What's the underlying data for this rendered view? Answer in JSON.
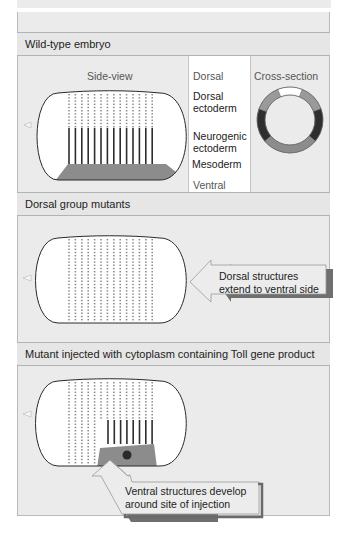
{
  "figure": {
    "sections": [
      {
        "title": "Wild-type embryo",
        "side_view_label": "Side-view",
        "cross_section_label": "Cross-section",
        "axis_labels": {
          "top": "Dorsal",
          "bottom": "Ventral"
        },
        "tissue_labels": [
          "Dorsal ectoderm",
          "Neurogenic ectoderm",
          "Mesoderm"
        ],
        "tissue_labels_lines": [
          [
            "Dorsal",
            "ectoderm"
          ],
          [
            "Neurogenic",
            "ectoderm"
          ],
          [
            "Mesoderm"
          ]
        ]
      },
      {
        "title": "Dorsal group mutants",
        "callout_lines": [
          "Dorsal structures",
          "extend to ventral side"
        ]
      },
      {
        "title": "Mutant injected with cytoplasm containing Toll gene product",
        "callout_lines": [
          "Ventral structures develop",
          "around site of injection"
        ]
      }
    ],
    "colors": {
      "background": "#ebebeb",
      "panel_white": "#ffffff",
      "mesoderm": "#8c8c8c",
      "neurogenic_ectoderm": "#2e2e2e",
      "dorsal_ectoderm": "#9a9a9a",
      "amnioserosa": "#ffffff",
      "dots": "#8a8a8a",
      "outline": "#2a2a2a"
    }
  }
}
